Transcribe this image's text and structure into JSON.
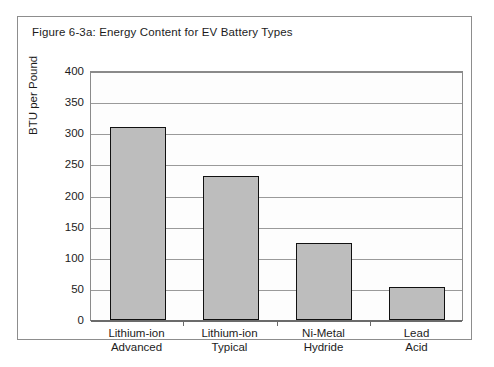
{
  "figure": {
    "title": "Figure 6-3a:  Energy Content for EV Battery Types"
  },
  "chart_data": {
    "type": "bar",
    "title": "Figure 6-3a:  Energy Content for EV Battery Types",
    "xlabel": "",
    "ylabel": "BTU per Pound",
    "ylim": [
      0,
      400
    ],
    "ytick_step": 50,
    "yticks": [
      "400",
      "350",
      "300",
      "250",
      "200",
      "150",
      "100",
      "50",
      "0"
    ],
    "grid": true,
    "legend": "none",
    "categories": [
      "Lithium-ion Advanced",
      "Lithium-ion Typical",
      "Ni-Metal Hydride",
      "Lead Acid"
    ],
    "category_lines": [
      [
        "Lithium-ion",
        "Advanced"
      ],
      [
        "Lithium-ion",
        "Typical"
      ],
      [
        "Ni-Metal",
        "Hydride"
      ],
      [
        "Lead",
        "Acid"
      ]
    ],
    "values": [
      310,
      232,
      123,
      53
    ],
    "series": [
      {
        "name": "BTU per Pound",
        "values": [
          310,
          232,
          123,
          53
        ]
      }
    ],
    "colors": {
      "bar_fill": "#bdbdbd",
      "bar_border": "#111111",
      "gridline": "#9a9a9a",
      "axis": "#6b6b6b",
      "plot_background": "#fdfdfd",
      "text": "#1c1c1c",
      "frame": "#8d8d8d"
    }
  }
}
